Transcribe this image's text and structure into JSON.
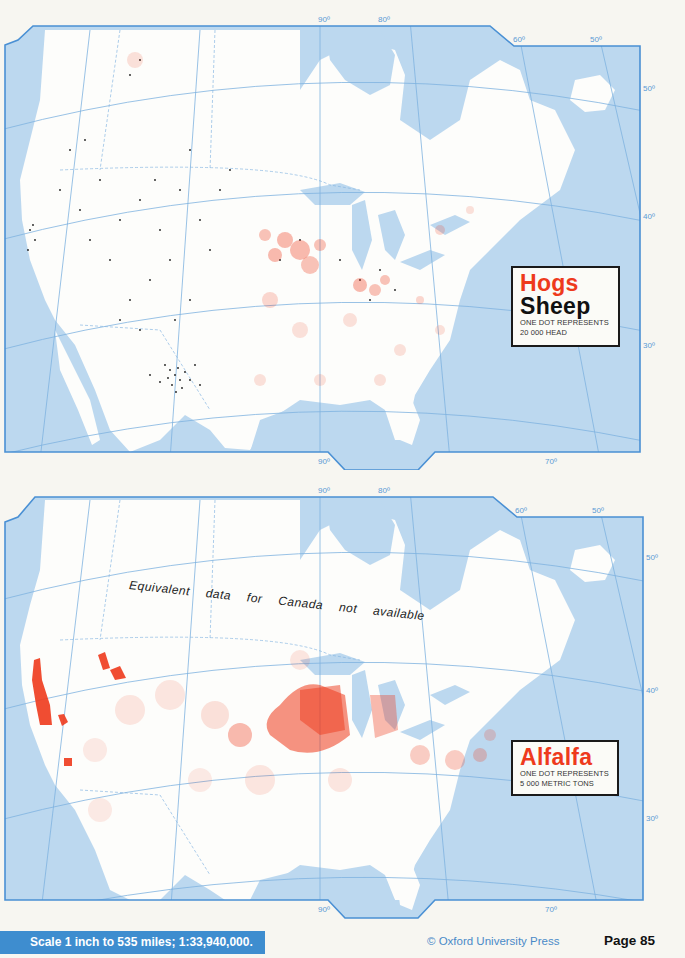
{
  "maps": {
    "top": {
      "legend": {
        "title_1": "Hogs",
        "title_2": "Sheep",
        "line_1": "ONE DOT REPRESENTS",
        "line_2": "20 000 HEAD"
      },
      "longitude_labels": [
        "90º",
        "80º",
        "60º",
        "50º"
      ],
      "bottom_longitude_labels": [
        "90º",
        "70º"
      ],
      "latitude_labels": [
        "50º",
        "40º",
        "30º"
      ],
      "series": [
        {
          "name": "Hogs",
          "color": "#ee3a1c"
        },
        {
          "name": "Sheep",
          "color": "#1a1a1a"
        }
      ]
    },
    "bottom": {
      "legend": {
        "title_1": "Alfalfa",
        "line_1": "ONE DOT REPRESENTS",
        "line_2": "5 000 METRIC TONS"
      },
      "note_words": [
        "Equivalent",
        "data",
        "for",
        "Canada",
        "not",
        "available"
      ],
      "longitude_labels": [
        "90º",
        "80º",
        "60º",
        "50º"
      ],
      "bottom_longitude_labels": [
        "90º",
        "70º"
      ],
      "latitude_labels": [
        "50º",
        "40º",
        "30º"
      ],
      "series": [
        {
          "name": "Alfalfa",
          "color": "#ee3a1c"
        }
      ]
    }
  },
  "footer": {
    "scale": "Scale 1 inch to 535 miles; 1:33,940,000.",
    "copyright": "© Oxford University Press",
    "page": "Page 85"
  },
  "colors": {
    "water": "#bcd8ef",
    "frame": "#4a90d4",
    "dots_red": "#ee3a1c",
    "dots_black": "#1a1a1a",
    "scale_bar": "#3e8dcf"
  }
}
